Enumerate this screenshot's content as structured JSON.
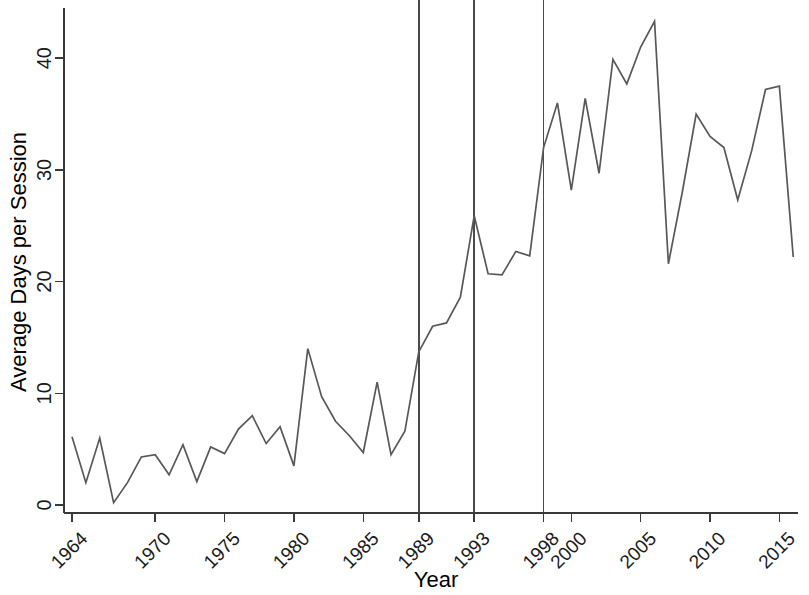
{
  "chart_data": {
    "type": "line",
    "title": "",
    "xlabel": "Year",
    "ylabel": "Average Days per Session",
    "xlim": [
      1964,
      2016
    ],
    "ylim": [
      0,
      45
    ],
    "grid": false,
    "legend": "none",
    "x_tick_labels": [
      "1964",
      "1970",
      "1975",
      "1980",
      "1985",
      "1989",
      "1993",
      "1998",
      "2000",
      "2005",
      "2010",
      "2015"
    ],
    "x_tick_values": [
      1964,
      1970,
      1975,
      1980,
      1985,
      1989,
      1993,
      1998,
      2000,
      2005,
      2010,
      2015
    ],
    "y_tick_labels": [
      "0",
      "10",
      "20",
      "30",
      "40"
    ],
    "y_tick_values": [
      0,
      10,
      20,
      30,
      40
    ],
    "reference_lines": [
      {
        "x": 1989,
        "label": "1989"
      },
      {
        "x": 1993,
        "label": "1993"
      },
      {
        "x": 1998,
        "label": "1998"
      }
    ],
    "line_color": "#585858",
    "axis_color": "#3a3a3a",
    "x": [
      1964,
      1965,
      1966,
      1967,
      1968,
      1969,
      1970,
      1971,
      1972,
      1973,
      1974,
      1975,
      1976,
      1977,
      1978,
      1979,
      1980,
      1981,
      1982,
      1983,
      1984,
      1985,
      1986,
      1987,
      1988,
      1989,
      1990,
      1991,
      1992,
      1993,
      1994,
      1995,
      1996,
      1997,
      1998,
      1999,
      2000,
      2001,
      2002,
      2003,
      2004,
      2005,
      2006,
      2007,
      2008,
      2009,
      2010,
      2011,
      2012,
      2013,
      2014,
      2015,
      2016
    ],
    "values": [
      6.1,
      2.0,
      6.0,
      0.2,
      2.0,
      4.3,
      4.5,
      2.7,
      5.4,
      2.1,
      5.2,
      4.6,
      6.8,
      8.0,
      5.5,
      7.0,
      3.5,
      14.0,
      9.7,
      7.5,
      6.2,
      4.7,
      11.0,
      4.5,
      6.6,
      13.7,
      16.0,
      16.3,
      18.6,
      25.9,
      20.7,
      20.6,
      22.7,
      22.3,
      32.0,
      36.0,
      28.2,
      36.4,
      29.7,
      39.9,
      37.7,
      41.0,
      43.3,
      21.6,
      28.0,
      35.0,
      33.0,
      32.0,
      27.3,
      31.7,
      37.2,
      37.5,
      22.2
    ]
  },
  "axis_titles": {
    "x": "Year",
    "y": "Average Days per Session"
  }
}
